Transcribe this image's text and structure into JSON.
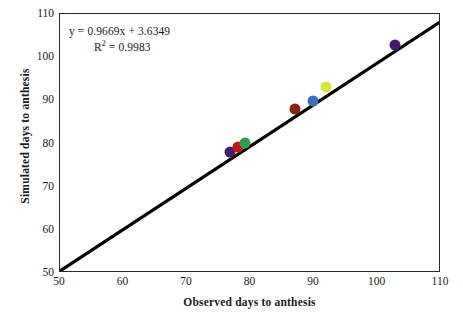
{
  "chart_data": {
    "type": "scatter",
    "title": "",
    "xlabel": "Observed days to anthesis",
    "ylabel": "Simulated days to anthesis",
    "xlim": [
      50,
      110
    ],
    "ylim": [
      50,
      110
    ],
    "xticks": [
      50,
      60,
      70,
      80,
      90,
      100,
      110
    ],
    "yticks": [
      50,
      60,
      70,
      80,
      90,
      100,
      110
    ],
    "grid": false,
    "legend": null,
    "annotations": {
      "equation": "y = 0.9669x + 3.6349",
      "r_squared_prefix": "R",
      "r_squared_sup": "2",
      "r_squared_value": " = 0.9983",
      "r_squared_full": "R2 = 0.9983"
    },
    "reference_line": {
      "name": "1:1 line",
      "x_start": 50,
      "y_start": 50,
      "x_end": 110,
      "y_end": 108,
      "color": "#000000",
      "width_px": 3.2
    },
    "points": [
      {
        "label": "point-1",
        "x": 76.8,
        "y": 78.0,
        "color": "#4a1a6b",
        "size_px": 11
      },
      {
        "label": "point-2",
        "x": 78.0,
        "y": 79.2,
        "color": "#c01818",
        "size_px": 11
      },
      {
        "label": "point-3",
        "x": 79.2,
        "y": 80.2,
        "color": "#2e9e4a",
        "size_px": 11
      },
      {
        "label": "point-4",
        "x": 87.0,
        "y": 88.0,
        "color": "#8a2410",
        "size_px": 11
      },
      {
        "label": "point-5",
        "x": 89.9,
        "y": 89.9,
        "color": "#3a6fc4",
        "size_px": 11
      },
      {
        "label": "point-6",
        "x": 91.9,
        "y": 93.0,
        "color": "#d8e33c",
        "size_px": 11
      },
      {
        "label": "point-7",
        "x": 102.8,
        "y": 102.9,
        "color": "#44196e",
        "size_px": 11
      }
    ]
  },
  "colors": {
    "background": "#ffffff",
    "frame": "#2b2b2b",
    "text": "#1a1a1a",
    "reference_line": "#000000"
  }
}
